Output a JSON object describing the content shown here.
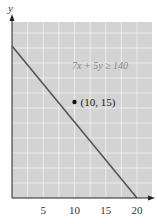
{
  "chart_data": {
    "type": "line",
    "title": "",
    "xlabel": "",
    "ylabel": "y",
    "xlim": [
      0,
      22
    ],
    "ylim": [
      0,
      28
    ],
    "x_ticks": [
      5,
      10,
      15,
      20
    ],
    "x_tick_labels": [
      "5",
      "10",
      "15",
      "20"
    ],
    "grid": true,
    "grid_step": 2.5,
    "shaded_region": "7x + 5y ≥ 140 (whole plot shaded)",
    "series": [
      {
        "name": "7x + 5y = 140",
        "x": [
          0,
          20
        ],
        "y": [
          28,
          0
        ]
      }
    ],
    "points": [
      {
        "x": 10,
        "y": 15,
        "label": "(10, 15)"
      }
    ],
    "annotations": [
      {
        "text": "7x + 5y ≥ 140",
        "x": 13,
        "y": 22
      }
    ],
    "colors": {
      "shade": "#d3d3d3",
      "grid": "#f2f2f2",
      "line": "#555555",
      "axis": "#222222",
      "annotation": "#8a8a8a"
    }
  }
}
